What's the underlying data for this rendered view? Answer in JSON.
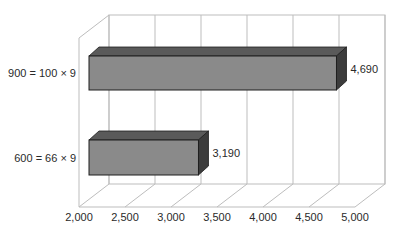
{
  "chart_data": {
    "type": "bar",
    "orientation": "horizontal",
    "style": "3d",
    "title": "",
    "xlabel": "",
    "ylabel": "",
    "categories": [
      "900 = 100 × 9",
      "600  = 66 × 9"
    ],
    "values": [
      4690,
      3190
    ],
    "data_labels": [
      "4,690",
      "3,190"
    ],
    "xlim": [
      2000,
      5000
    ],
    "x_ticks": [
      "2,000",
      "2,500",
      "3,000",
      "3,500",
      "4,000",
      "4,500",
      "5,000"
    ],
    "grid": true,
    "legend": null
  },
  "colors": {
    "bar_front": "#8a8a8a",
    "bar_top": "#5a5a5a",
    "bar_side": "#3c3c3c",
    "bar_edge": "#1e1e1e",
    "grid": "#bdbdbd",
    "text": "#2a2a2a"
  }
}
